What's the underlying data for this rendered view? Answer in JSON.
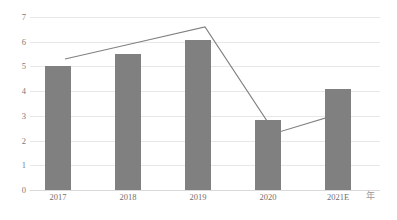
{
  "chart_data": {
    "type": "bar",
    "title": "",
    "xlabel": "年",
    "ylabel": "",
    "categories": [
      "2017",
      "2018",
      "2019",
      "2020",
      "2021E"
    ],
    "ylim": [
      0,
      7
    ],
    "ytick_labels": [
      "0",
      "1",
      "2",
      "3",
      "4",
      "5",
      "6",
      "7"
    ],
    "grid": true,
    "legend": "none",
    "series": [
      {
        "name": "bars",
        "type": "bar",
        "color": "#808080",
        "values": [
          5.0,
          5.5,
          6.05,
          2.85,
          4.07
        ]
      },
      {
        "name": "line",
        "type": "line",
        "color": "#808080",
        "values": [
          5.3,
          5.95,
          6.6,
          2.3,
          3.15
        ]
      }
    ]
  },
  "axis": {
    "unit_label": "年"
  }
}
